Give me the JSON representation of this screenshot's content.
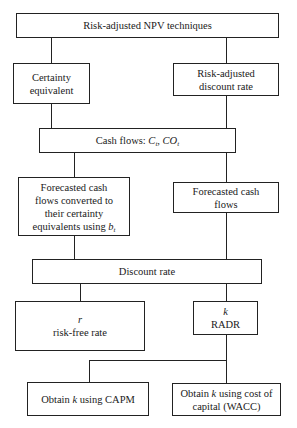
{
  "diagram": {
    "title": "Risk-adjusted NPV techniques",
    "nodes": {
      "root": {
        "label": "Risk-adjusted NPV techniques"
      },
      "certainty_equivalent": {
        "line1": "Certainty",
        "line2": "equivalent"
      },
      "radr_method": {
        "line1": "Risk-adjusted",
        "line2": "discount rate"
      },
      "cash_flows": {
        "prefix": "Cash flows: ",
        "var1": "C",
        "sub1": "t",
        "sep": ", ",
        "var2": "CO",
        "sub2": "t"
      },
      "forecast_converted": {
        "line1": "Forecasted cash",
        "line2": "flows converted to",
        "line3": "their certainty",
        "line4_prefix": "equivalents using ",
        "var": "b",
        "sub": "t"
      },
      "forecast_flows": {
        "line1": "Forecasted cash",
        "line2": "flows"
      },
      "discount_rate": {
        "label": "Discount rate"
      },
      "risk_free": {
        "symbol": "r",
        "label": "risk-free rate"
      },
      "radr": {
        "symbol": "k",
        "label": "RADR"
      },
      "capm": {
        "prefix": "Obtain ",
        "var": "k",
        "suffix": " using CAPM"
      },
      "wacc": {
        "prefix": "Obtain ",
        "var": "k",
        "suffix": " using cost of",
        "line2": "capital (WACC)"
      }
    },
    "edges": [
      [
        "root",
        "certainty_equivalent"
      ],
      [
        "root",
        "radr_method"
      ],
      [
        "certainty_equivalent",
        "cash_flows"
      ],
      [
        "radr_method",
        "cash_flows"
      ],
      [
        "cash_flows",
        "forecast_converted"
      ],
      [
        "cash_flows",
        "forecast_flows"
      ],
      [
        "forecast_converted",
        "discount_rate"
      ],
      [
        "forecast_flows",
        "discount_rate"
      ],
      [
        "discount_rate",
        "risk_free"
      ],
      [
        "discount_rate",
        "radr"
      ],
      [
        "radr",
        "capm"
      ],
      [
        "radr",
        "wacc"
      ]
    ]
  }
}
